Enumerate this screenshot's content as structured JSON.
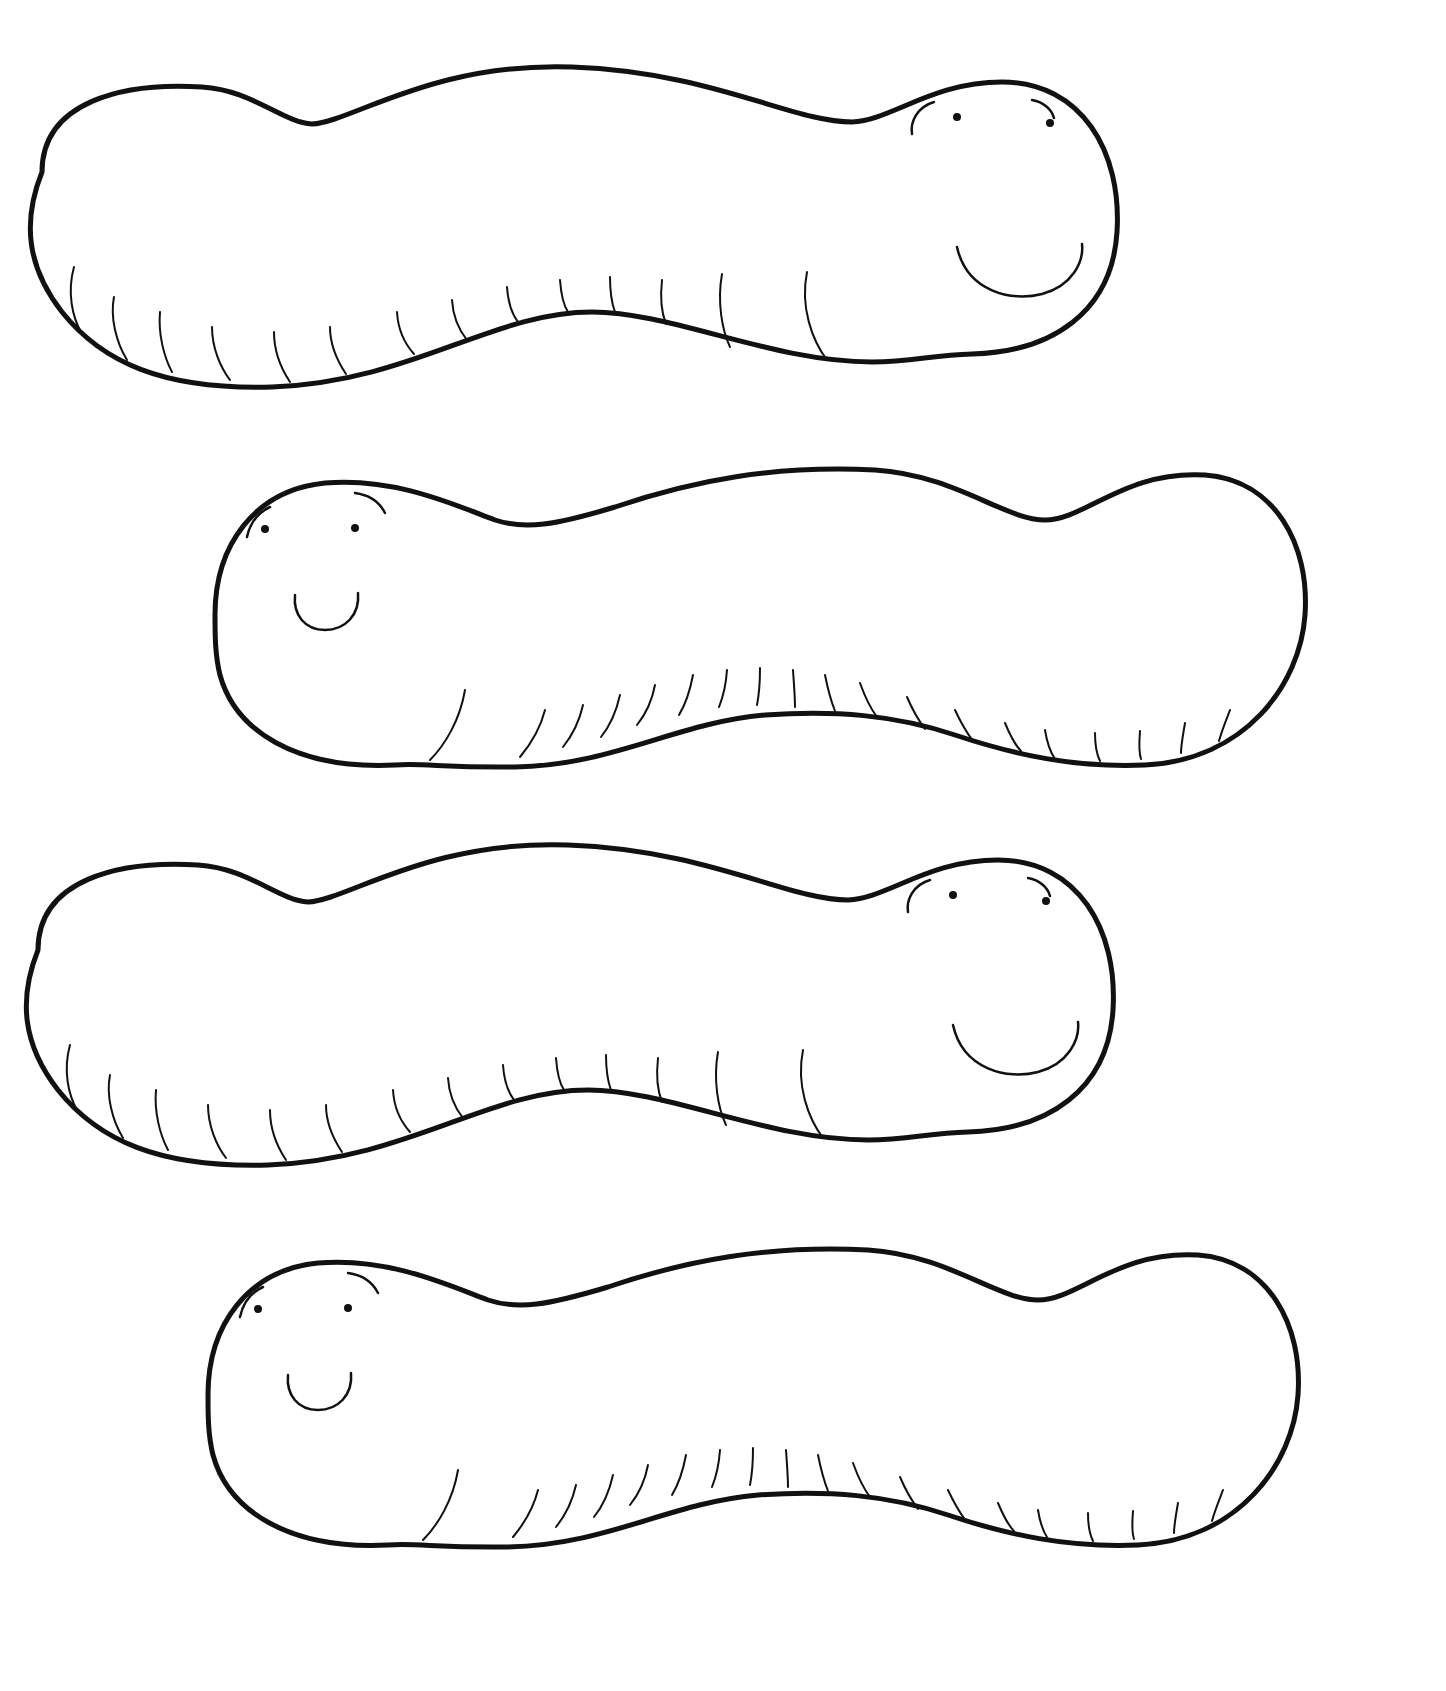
{
  "page": {
    "type": "coloring-page",
    "background": "#ffffff",
    "line_color": "#111111"
  },
  "worms": [
    {
      "id": 1,
      "facing": "right",
      "position": "top",
      "expression": "smile"
    },
    {
      "id": 2,
      "facing": "left",
      "position": "second",
      "expression": "smile"
    },
    {
      "id": 3,
      "facing": "right",
      "position": "third",
      "expression": "smile"
    },
    {
      "id": 4,
      "facing": "left",
      "position": "bottom",
      "expression": "smile"
    }
  ]
}
